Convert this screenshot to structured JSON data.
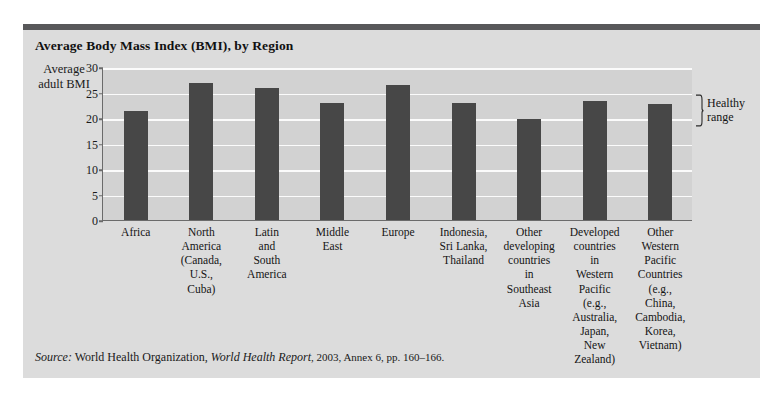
{
  "chart_data": {
    "type": "bar",
    "title": "Average Body Mass Index (BMI), by Region",
    "xlabel": "",
    "ylabel": "Average adult BMI",
    "ylim": [
      0,
      30
    ],
    "yticks": [
      0,
      5,
      10,
      15,
      20,
      25,
      30
    ],
    "grid": true,
    "legend": "none",
    "bar_color": "#474747",
    "plot_background": "#d2d2d2",
    "gridline_color": "#fbfbfb",
    "categories": [
      "Africa",
      "North America (Canada, U.S., Cuba)",
      "Latin and South America",
      "Middle East",
      "Europe",
      "Indonesia, Sri Lanka, Thailand",
      "Other developing countries in Southeast Asia",
      "Developed countries in Western Pacific (e.g., Australia, Japan, New Zealand)",
      "Other Western Pacific Countries (e.g., China, Cambodia, Korea, Vietnam)"
    ],
    "category_lines": [
      [
        "Africa"
      ],
      [
        "North",
        "America",
        "(Canada,",
        "U.S.,",
        "Cuba)"
      ],
      [
        "Latin",
        "and",
        "South",
        "America"
      ],
      [
        "Middle",
        "East"
      ],
      [
        "Europe"
      ],
      [
        "Indonesia,",
        "Sri Lanka,",
        "Thailand"
      ],
      [
        "Other",
        "developing",
        "countries",
        "in",
        "Southeast",
        "Asia"
      ],
      [
        "Developed",
        "countries",
        "in",
        "Western",
        "Pacific",
        "(e.g.,",
        "Australia,",
        "Japan,",
        "New",
        "Zealand)"
      ],
      [
        "Other",
        "Western",
        "Pacific",
        "Countries",
        "(e.g.,",
        "China,",
        "Cambodia,",
        "Korea,",
        "Vietnam)"
      ]
    ],
    "values": [
      21.4,
      26.8,
      25.9,
      23.0,
      26.5,
      23.0,
      19.8,
      23.3,
      22.7
    ],
    "annotations": [
      {
        "label": "Healthy range",
        "label_lines": [
          "Healthy",
          "range"
        ],
        "y_range": [
          18.5,
          25.0
        ],
        "position": "right"
      }
    ]
  },
  "source": {
    "prefix": "Source:",
    "organization": "World Health Organization,",
    "publication": "World Health Report",
    "details": ", 2003, Annex 6, pp. 160–166."
  }
}
